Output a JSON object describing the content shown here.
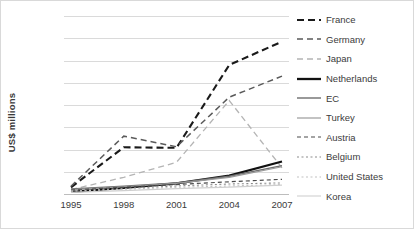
{
  "chart_data": {
    "type": "line",
    "title": "",
    "xlabel": "",
    "ylabel": "US$ millions",
    "x": [
      1995,
      1998,
      2001,
      2004,
      2007
    ],
    "xtick_labels": [
      "1995",
      "1998",
      "2001",
      "2004",
      "2007"
    ],
    "ytick_labels": [
      "0",
      "200",
      "400",
      "600",
      "800",
      "1 000",
      "1 200",
      "1 400",
      "1 600"
    ],
    "ytick_values": [
      0,
      200,
      400,
      600,
      800,
      1000,
      1200,
      1400,
      1600
    ],
    "ylim": [
      0,
      1600
    ],
    "grid": true,
    "legend_position": "right",
    "series": [
      {
        "name": "France",
        "values": [
          60,
          420,
          415,
          1160,
          1370
        ],
        "style": "dashed-bold",
        "color": "#1a1a1a",
        "width": 2.1,
        "dash": "7,4"
      },
      {
        "name": "Germany",
        "values": [
          70,
          520,
          425,
          870,
          1060
        ],
        "style": "dashed",
        "color": "#5a5a5a",
        "width": 1.5,
        "dash": "6,4"
      },
      {
        "name": "Japan",
        "values": [
          40,
          150,
          285,
          840,
          235
        ],
        "style": "dashed-light",
        "color": "#b4b4b4",
        "width": 1.3,
        "dash": "6,4"
      },
      {
        "name": "Netherlands",
        "values": [
          20,
          55,
          95,
          165,
          292
        ],
        "style": "solid-bold",
        "color": "#111111",
        "width": 2.3,
        "dash": "none"
      },
      {
        "name": "EC",
        "values": [
          45,
          70,
          100,
          160,
          255
        ],
        "style": "solid",
        "color": "#6e6e6e",
        "width": 1.4,
        "dash": "none"
      },
      {
        "name": "Turkey",
        "values": [
          40,
          65,
          95,
          150,
          245
        ],
        "style": "solid-light",
        "color": "#9a9a9a",
        "width": 1.2,
        "dash": "none"
      },
      {
        "name": "Austria",
        "values": [
          35,
          60,
          85,
          110,
          132
        ],
        "style": "dashed-short",
        "color": "#4a4a4a",
        "width": 1.2,
        "dash": "4,3"
      },
      {
        "name": "Belgium",
        "values": [
          30,
          50,
          72,
          90,
          100
        ],
        "style": "dotted",
        "color": "#8c8c8c",
        "width": 1.1,
        "dash": "2,2.5"
      },
      {
        "name": "United States",
        "values": [
          25,
          42,
          60,
          72,
          85
        ],
        "style": "dotted-light",
        "color": "#c2c2c2",
        "width": 1.1,
        "dash": "2,2.5"
      },
      {
        "name": "Korea",
        "values": [
          15,
          30,
          48,
          62,
          80
        ],
        "style": "solid-faint",
        "color": "#cfcfcf",
        "width": 1.1,
        "dash": "none"
      }
    ]
  }
}
